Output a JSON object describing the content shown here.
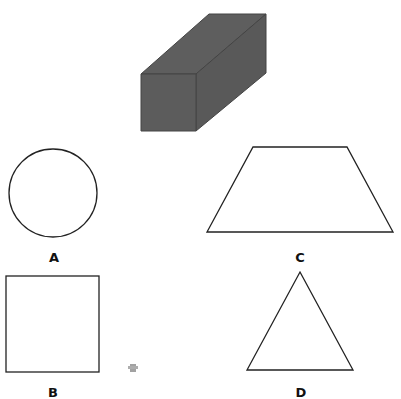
{
  "prism": {
    "fill": "#5c5c5c",
    "edge": "#3a3a3a"
  },
  "options": [
    {
      "label": "A",
      "shape": "circle"
    },
    {
      "label": "B",
      "shape": "square"
    },
    {
      "label": "C",
      "shape": "trapezoid"
    },
    {
      "label": "D",
      "shape": "triangle"
    }
  ],
  "stroke_color": "#222222"
}
